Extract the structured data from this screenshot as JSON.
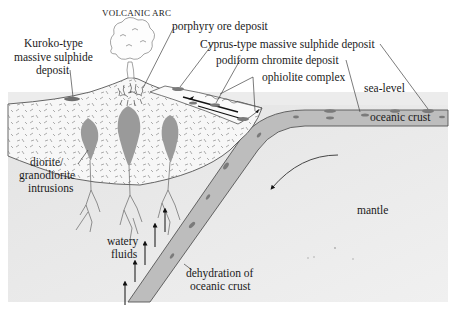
{
  "labels": {
    "volcanic_arc": "VOLCANIC ARC",
    "porphyry": "porphyry ore deposit",
    "kuroko_1": "Kuroko-type",
    "kuroko_2": "massive sulphide",
    "kuroko_3": "deposit",
    "cyprus": "Cyprus-type massive sulphide deposit",
    "podiform": "podiform chromite deposit",
    "ophiolite": "ophiolite complex",
    "sea_level": "sea-level",
    "oceanic_crust": "oceanic crust",
    "diorite_1": "diorite/",
    "diorite_2": "granodiorite",
    "diorite_3": "intrusions",
    "mantle": "mantle",
    "watery_1": "watery",
    "watery_2": "fluids",
    "dehydration_1": "dehydration of",
    "dehydration_2": "oceanic crust"
  },
  "colors": {
    "sea": "#ececec",
    "mantle": "#e8e8e8",
    "slab": "#bdbdbd",
    "intrusion": "#9a9a9a",
    "deposit": "#7a7a7a",
    "arc_fill": "#f7f7f7",
    "outline": "#555555"
  }
}
